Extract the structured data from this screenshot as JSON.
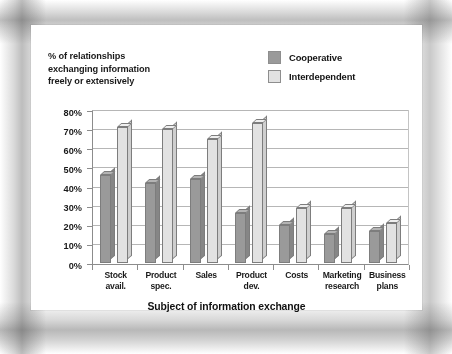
{
  "chart_data": {
    "type": "bar",
    "title": "",
    "note_lines": [
      "% of relationships",
      "exchanging information",
      "freely or extensively"
    ],
    "xlabel": "Subject of information exchange",
    "ylabel": "",
    "ylim": [
      0,
      80
    ],
    "ytick_labels": [
      "0%",
      "10%",
      "20%",
      "30%",
      "40%",
      "50%",
      "60%",
      "70%",
      "80%"
    ],
    "ytick_values": [
      0,
      10,
      20,
      30,
      40,
      50,
      60,
      70,
      80
    ],
    "grid": true,
    "legend_position": "top-right",
    "categories": [
      [
        "Stock",
        "avail."
      ],
      [
        "Product",
        "spec."
      ],
      [
        "Sales"
      ],
      [
        "Product",
        "dev."
      ],
      [
        "Costs"
      ],
      [
        "Marketing",
        "research"
      ],
      [
        "Business",
        "plans"
      ]
    ],
    "category_names": [
      "Stock avail.",
      "Product spec.",
      "Sales",
      "Product dev.",
      "Costs",
      "Marketing research",
      "Business plans"
    ],
    "series": [
      {
        "name": "Cooperative",
        "color": "#9a9a9a",
        "values": [
          46,
          42,
          44,
          26,
          20,
          15,
          17
        ]
      },
      {
        "name": "Interdependent",
        "color": "#e2e2e2",
        "values": [
          71,
          70,
          65,
          73,
          29,
          29,
          21
        ]
      }
    ]
  }
}
